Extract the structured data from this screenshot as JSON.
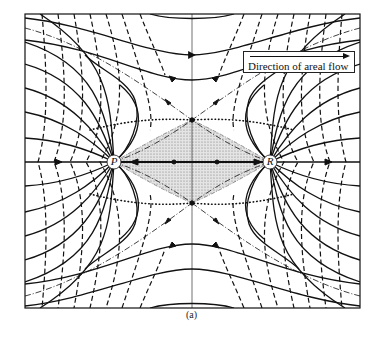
{
  "figure": {
    "caption": "(a)",
    "legend": {
      "label": "Direction of areal flow",
      "arrow": "right"
    },
    "points": [
      {
        "id": "P",
        "label": "P",
        "x": 114,
        "y": 162,
        "role": "source"
      },
      {
        "id": "R",
        "label": "R",
        "x": 270,
        "y": 162,
        "role": "sink"
      }
    ],
    "saddles": [
      {
        "x": 192,
        "y": 120
      },
      {
        "x": 192,
        "y": 203
      }
    ],
    "line_styles": {
      "flow_lines": "solid with arrowheads",
      "equipotential_lines": "dashed",
      "separatrices": "dash-dot",
      "saddle_contours": "dotted",
      "shaded_region": "stippled diamond between P and R"
    },
    "colors": {
      "ink": "#111111",
      "shade": "#bdbdbd",
      "background": "#ffffff"
    }
  }
}
